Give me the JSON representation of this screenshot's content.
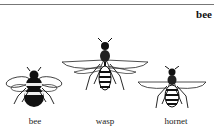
{
  "header": {
    "headword": "bee"
  },
  "illustrations": [
    {
      "caption": "bee",
      "icon": "bee-icon"
    },
    {
      "caption": "wasp",
      "icon": "wasp-icon"
    },
    {
      "caption": "hornet",
      "icon": "hornet-icon"
    }
  ],
  "colors": {
    "rule": "#777777",
    "ink": "#111111",
    "background": "#ffffff"
  }
}
